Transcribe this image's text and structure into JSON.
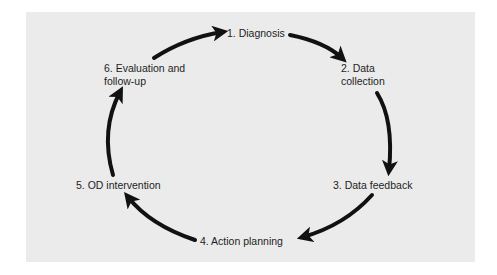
{
  "diagram": {
    "type": "cycle",
    "colors": {
      "background": "#ebebeb",
      "arrow": "#111111",
      "text": "#1e1e1e"
    },
    "steps": [
      {
        "id": 1,
        "label": "1. Diagnosis"
      },
      {
        "id": 2,
        "line1": "2. Data",
        "line2": "collection"
      },
      {
        "id": 3,
        "label": "3. Data feedback"
      },
      {
        "id": 4,
        "label": "4. Action planning"
      },
      {
        "id": 5,
        "label": "5. OD intervention"
      },
      {
        "id": 6,
        "line1": "6. Evaluation and",
        "line2": "follow-up"
      }
    ],
    "edges": [
      {
        "from": 1,
        "to": 2
      },
      {
        "from": 2,
        "to": 3
      },
      {
        "from": 3,
        "to": 4
      },
      {
        "from": 4,
        "to": 5
      },
      {
        "from": 5,
        "to": 6
      },
      {
        "from": 6,
        "to": 1
      }
    ]
  }
}
